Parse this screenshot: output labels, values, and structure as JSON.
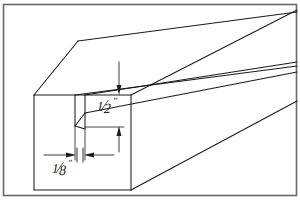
{
  "figure": {
    "type": "isometric-line-drawing",
    "background_color": "#ffffff",
    "line_color": "#1b1b1b",
    "border": {
      "present": true,
      "color": "#555555",
      "name": "figure-border-frame"
    }
  },
  "dimensions": [
    {
      "id": "groove-depth",
      "value": "1/2",
      "unit": "\"",
      "numerator": "1",
      "slash": "⁄",
      "denominator": "2",
      "inch_mark": "\"",
      "description": "depth of groove measured from top face down",
      "orientation": "vertical",
      "arrow_style": "double-arrow-inward"
    },
    {
      "id": "groove-width",
      "value": "1/8",
      "unit": "\"",
      "numerator": "1",
      "slash": "⁄",
      "denominator": "8",
      "inch_mark": "\"",
      "description": "width of groove kerf across the end face",
      "orientation": "horizontal",
      "arrow_style": "double-arrow-inward"
    }
  ],
  "geometry": {
    "end_face": {
      "name": "beam-end-face",
      "top_left": [
        34,
        95
      ],
      "top_right": [
        131,
        95
      ],
      "bottom_right": [
        131,
        190
      ],
      "bottom_left": [
        34,
        190
      ]
    },
    "top_face": {
      "name": "beam-top-face",
      "front_left": [
        34,
        95
      ],
      "back_left": [
        78,
        41
      ],
      "back_right": [
        297,
        10
      ],
      "front_right": [
        131,
        95
      ]
    },
    "side_face": {
      "name": "beam-side-face",
      "front_top": [
        131,
        95
      ],
      "front_bottom": [
        131,
        190
      ],
      "back_top": [
        297,
        10
      ],
      "back_bottom": [
        297,
        99
      ]
    },
    "groove": {
      "name": "beam-groove-kerf",
      "front_left_x": 75,
      "front_right_x": 85,
      "top_y": 95,
      "bottom_y": 129,
      "recede_to": [
        297,
        14
      ]
    }
  }
}
